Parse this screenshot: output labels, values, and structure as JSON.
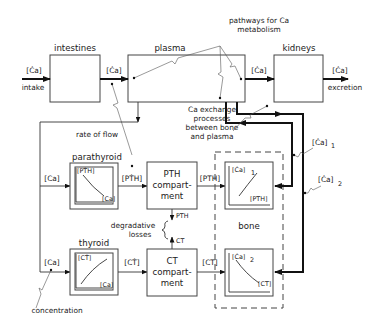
{
  "title": "pathways for Ca metabolism",
  "annotations": {
    "pathways_line1": "pathways for Ca",
    "pathways_line2": "metabolism",
    "rate_of_flow": "rate of flow",
    "concentration": "concentration",
    "exchange_line1": "Ca exchange",
    "exchange_line2": "processes",
    "exchange_line3": "between bone",
    "exchange_line4": "and plasma",
    "degradative_line1": "degradative",
    "degradative_line2": "losses"
  },
  "compartments": {
    "intestines": "intestines",
    "plasma": "plasma",
    "kidneys": "kidneys",
    "parathyroid": "parathyroid",
    "thyroid": "thyroid",
    "pth_comp_line1": "PTH",
    "pth_comp_line2": "compart-",
    "pth_comp_line3": "ment",
    "ct_comp_line1": "CT",
    "ct_comp_line2": "compart-",
    "ct_comp_line3": "ment",
    "bone": "bone"
  },
  "flows": {
    "intake_rate": "[Ċa]",
    "intake": "intake",
    "intestine_out": "[Ċa]",
    "plasma_out": "[Ċa]",
    "excretion_rate": "[Ċa]",
    "excretion": "excretion",
    "ca_to_parathyroid": "[Ca]",
    "ca_to_thyroid": "[Ca]",
    "pth_rate": "[PṪH]",
    "ct_rate": "[CṪ]",
    "pth_to_bone": "[PTH]",
    "ct_to_bone": "[CT]",
    "pth_loss": "PTH",
    "ct_loss": "CT",
    "ca1_label": "[Ċa]",
    "ca1_sub": "1",
    "ca2_label": "[Ċa]",
    "ca2_sub": "2"
  },
  "response_curves": {
    "parathyroid": {
      "y_label": "[PṪH]",
      "x_label": "[Ca]",
      "trend": "decreasing"
    },
    "thyroid": {
      "y_label": "[CṪ]",
      "x_label": "[Ca]",
      "trend": "increasing"
    },
    "bone_upper": {
      "y_label": "[Ċa]",
      "y_sub": "1",
      "x_label": "[PTH]",
      "trend": "increasing"
    },
    "bone_lower": {
      "y_label": "[Ċa]",
      "y_sub": "2",
      "x_label": "[CT]",
      "trend": "decreasing"
    }
  }
}
